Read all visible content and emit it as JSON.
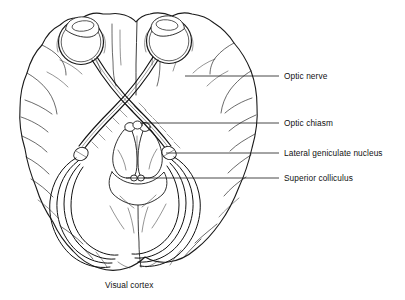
{
  "figure": {
    "background_color": "#ffffff",
    "ink_color": "#1a1a1a"
  },
  "labels": [
    {
      "id": "optic-nerve",
      "text": "Optic nerve",
      "text_x": 284,
      "text_y": 72,
      "leader": {
        "x1": 185,
        "y1": 76,
        "x2": 279,
        "y2": 76
      }
    },
    {
      "id": "optic-chiasm",
      "text": "Optic chiasm",
      "text_x": 284,
      "text_y": 119,
      "leader": {
        "x1": 140,
        "y1": 123,
        "x2": 279,
        "y2": 123
      }
    },
    {
      "id": "lateral-geniculate-nucleus",
      "text": "Lateral geniculate nucleus",
      "text_x": 284,
      "text_y": 149,
      "leader": {
        "x1": 166,
        "y1": 153,
        "x2": 279,
        "y2": 153
      }
    },
    {
      "id": "superior-colliculus",
      "text": "Superior colliculus",
      "text_x": 284,
      "text_y": 174,
      "leader": {
        "x1": 126,
        "y1": 178,
        "x2": 279,
        "y2": 178
      }
    }
  ],
  "caption": {
    "id": "visual-cortex",
    "text": "Visual cortex",
    "text_x": 105,
    "text_y": 281
  },
  "structures": [
    {
      "id": "left-eye",
      "name": "left eyeball"
    },
    {
      "id": "right-eye",
      "name": "right eyeball"
    },
    {
      "id": "optic-nerves",
      "name": "optic nerves"
    },
    {
      "id": "optic-chiasm",
      "name": "optic chiasm"
    },
    {
      "id": "optic-tracts",
      "name": "optic tracts"
    },
    {
      "id": "lgn-left",
      "name": "left lateral geniculate nucleus"
    },
    {
      "id": "lgn-right",
      "name": "right lateral geniculate nucleus"
    },
    {
      "id": "superior-colliculi",
      "name": "superior colliculi"
    },
    {
      "id": "optic-radiations",
      "name": "optic radiations"
    },
    {
      "id": "occipital-cortex",
      "name": "visual cortex"
    }
  ]
}
